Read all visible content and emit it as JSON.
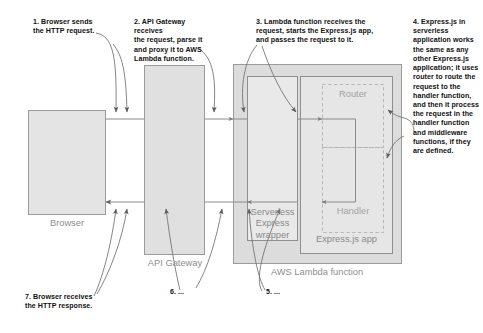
{
  "diagram": {
    "canvas": {
      "width": 483,
      "height": 333
    },
    "colors": {
      "page_background": "#ffffff",
      "box_fill": "#e2e2e2",
      "box_stroke": "#9a9a9a",
      "lambda_fill": "#dcdcdc",
      "inner_fill": "#eeeeee",
      "app_fill": "#ebebeb",
      "dashed_stroke": "#b4b4b4",
      "arrow_stroke": "#6f6f6f",
      "callout_text": "#111111",
      "box_label_text": "#8e8e8e"
    },
    "callouts": [
      {
        "id": "step-1",
        "number": "1.",
        "text": "1. Browser sends\nthe HTTP request."
      },
      {
        "id": "step-2",
        "number": "2.",
        "text": "2. API Gateway receives\nthe request, parse it\nand proxy it to AWS\nLambda function."
      },
      {
        "id": "step-3",
        "number": "3.",
        "text": "3. Lambda function receives the\nrequest, starts the Express.js app,\nand passes the request to it."
      },
      {
        "id": "step-4",
        "number": "4.",
        "text": "4. Express.js in\nserverless\napplication works\nthe same as any\nother Express.js\napplication; it uses\nrouter to route the\nrequest to the\nhandler function,\nand then it process\nthe request in the\nhandler function\nand middleware\nfunctions, if they\nare defined."
      },
      {
        "id": "step-5",
        "number": "5.",
        "text": "5. ..."
      },
      {
        "id": "step-6",
        "number": "6.",
        "text": "6. ..."
      },
      {
        "id": "step-7",
        "number": "7.",
        "text": "7. Browser receives\nthe HTTP response."
      }
    ],
    "nodes": [
      {
        "id": "browser",
        "label": "Browser",
        "style": "solid-filled"
      },
      {
        "id": "api-gateway",
        "label": "API Gateway",
        "style": "solid-filled"
      },
      {
        "id": "lambda",
        "label": "AWS Lambda function",
        "style": "solid-filled"
      },
      {
        "id": "serverless-wrapper",
        "label": "Serverless\nExpress\nwrapper",
        "style": "solid-inner"
      },
      {
        "id": "express-app",
        "label": "Express.js app",
        "style": "solid-inner"
      },
      {
        "id": "router",
        "label": "Router",
        "style": "dashed"
      },
      {
        "id": "handler",
        "label": "Handler",
        "style": "dashed"
      }
    ]
  }
}
